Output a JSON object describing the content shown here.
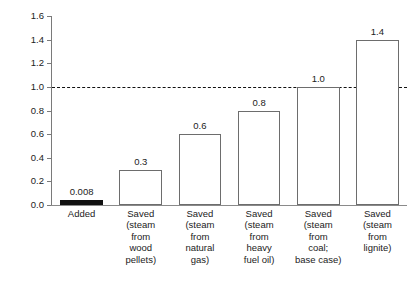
{
  "chart_data": {
    "type": "bar",
    "title": "",
    "subtitle": "",
    "xlabel": "",
    "ylabel": "",
    "ylim": [
      0.0,
      1.6
    ],
    "xlim": [
      0,
      6
    ],
    "grid": false,
    "legend": false,
    "legend_position": "none",
    "categories": [
      "Added",
      "Saved (steam from wood pellets)",
      "Saved (steam from natural gas)",
      "Saved (steam from heavy fuel oil)",
      "Saved (steam from coal; base case)",
      "Saved (steam from lignite)"
    ],
    "category_lines": [
      [
        "Added"
      ],
      [
        "Saved",
        "(steam",
        "from",
        "wood",
        "pellets)"
      ],
      [
        "Saved",
        "(steam",
        "from",
        "natural",
        "gas)"
      ],
      [
        "Saved",
        "(steam",
        "from",
        "heavy",
        "fuel oil)"
      ],
      [
        "Saved",
        "(steam",
        "from",
        "coal;",
        "base case)"
      ],
      [
        "Saved",
        "(steam",
        "from",
        "lignite)"
      ]
    ],
    "values": [
      0.008,
      0.3,
      0.6,
      0.8,
      1.0,
      1.4
    ],
    "value_labels": [
      "0.008",
      "0.3",
      "0.6",
      "0.8",
      "1.0",
      "1.4"
    ],
    "bar_styles": [
      "filled",
      "outlined",
      "outlined",
      "outlined",
      "outlined",
      "outlined"
    ],
    "bar_fill_color": "#111111",
    "bar_outline_color": "#6d6d6d",
    "bar_face_color": "#ffffff",
    "yticks": [
      0.0,
      0.2,
      0.4,
      0.6,
      0.8,
      1.0,
      1.2,
      1.4,
      1.6
    ],
    "ytick_labels": [
      "0.0",
      "0.2",
      "0.4",
      "0.6",
      "0.8",
      "1.0",
      "1.2",
      "1.4",
      "1.6"
    ],
    "annotations": [
      {
        "name": "reference-line",
        "type": "hline",
        "y": 1.0,
        "style": "dashed",
        "color": "#111111",
        "label": ""
      }
    ],
    "axis_color": "#7a7a7a",
    "background_color": "#ffffff",
    "text_color": "#222222"
  }
}
